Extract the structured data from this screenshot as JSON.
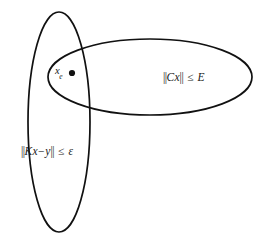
{
  "figure": {
    "kind": "venn-diagram",
    "background_color": "#ffffff",
    "stroke_color": "#111111",
    "text_color": "#1a1a1a"
  },
  "sets": {
    "left_ellipse": {
      "name": "data-fidelity-set",
      "label_parts": {
        "norm_open": "||",
        "operator_matrix": "K",
        "variable": "x",
        "minus": "−",
        "measurement": "y",
        "norm_close": "||",
        "relation": "≤",
        "bound": "ε"
      },
      "label_text": "||Kx−y|| ≤ ε"
    },
    "right_ellipse": {
      "name": "regularization-set",
      "label_parts": {
        "norm_open": "||",
        "operator_matrix": "C",
        "variable": "x",
        "norm_close": "||",
        "relation": "≤",
        "bound": "E"
      },
      "label_text": "||Cx|| ≤ E"
    }
  },
  "point": {
    "name": "solution-point",
    "symbol": "x",
    "subscript": "e",
    "label_text": "x",
    "marker": "filled-dot"
  },
  "chart_data": {
    "type": "diagram",
    "title": "",
    "shapes": [
      {
        "id": "left-ellipse",
        "shape": "ellipse",
        "cx": 59,
        "cy": 122,
        "rx": 31,
        "ry": 110,
        "rotation": 0,
        "label": "||Kx−y|| ≤ ε"
      },
      {
        "id": "right-ellipse",
        "shape": "ellipse",
        "cx": 150,
        "cy": 77,
        "rx": 102,
        "ry": 38,
        "rotation": 0,
        "label": "||Cx|| ≤ E"
      }
    ],
    "points": [
      {
        "id": "solution-point",
        "x": 72,
        "y": 73,
        "label": "x_e",
        "marker": "filled-dot",
        "radius": 3.1
      }
    ],
    "legend": null,
    "grid": false
  }
}
